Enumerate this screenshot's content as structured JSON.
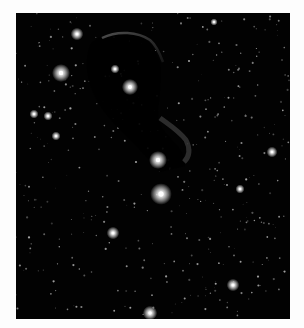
{
  "image": {
    "subject": "starfield with dark nebula",
    "background_color": "#fdfdfd",
    "sky_color": "#020202",
    "nebula_edge_color": "#6a6a6a",
    "bright_stars": [
      {
        "x": 61,
        "y": 73,
        "r": 5
      },
      {
        "x": 77,
        "y": 34,
        "r": 3.5
      },
      {
        "x": 130,
        "y": 87,
        "r": 4.5
      },
      {
        "x": 158,
        "y": 160,
        "r": 5
      },
      {
        "x": 161,
        "y": 194,
        "r": 6
      },
      {
        "x": 113,
        "y": 233,
        "r": 3.5
      },
      {
        "x": 233,
        "y": 285,
        "r": 3.5
      },
      {
        "x": 150,
        "y": 313,
        "r": 4
      },
      {
        "x": 272,
        "y": 152,
        "r": 3
      },
      {
        "x": 240,
        "y": 189,
        "r": 2.5
      },
      {
        "x": 34,
        "y": 114,
        "r": 2.5
      },
      {
        "x": 48,
        "y": 116,
        "r": 2.5
      },
      {
        "x": 56,
        "y": 136,
        "r": 2.5
      },
      {
        "x": 115,
        "y": 69,
        "r": 2.5
      },
      {
        "x": 214,
        "y": 22,
        "r": 2
      }
    ]
  }
}
